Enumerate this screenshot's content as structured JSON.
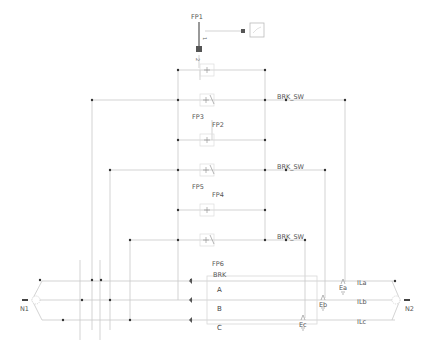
{
  "diagram": {
    "type": "power-circuit-schematic",
    "colors": {
      "wire": "#c8c8c8",
      "wire_dark": "#b0b0b0",
      "node": "#333333",
      "fault_block": "#555555",
      "label": "#555555",
      "bus_box": "#d8d8d8"
    },
    "labels": {
      "fp1": "FP1",
      "fp2": "FP2",
      "fp3": "FP3",
      "fp4": "FP4",
      "fp5": "FP5",
      "fp6": "FP6",
      "brk_sw_1": "BRK_SW",
      "brk_sw_2": "BRK_SW",
      "brk_sw_3": "BRK_SW",
      "brk": "BRK",
      "phase_a": "A",
      "phase_b": "B",
      "phase_c": "C",
      "ea": "Ea",
      "eb": "Eb",
      "ec": "Ec",
      "ila": "ILa",
      "ilb": "ILb",
      "ilc": "ILc",
      "n1": "N1",
      "n2": "N2",
      "port_1": "1",
      "port_2": "2"
    },
    "icons": {
      "source_a": "voltage-source-icon",
      "source_b": "voltage-source-icon",
      "source_c": "voltage-source-icon",
      "scope": "scope-icon",
      "fault_block": "fault-block-icon",
      "switch": "switch-icon",
      "current_meter": "current-meter-icon",
      "node_connector": "three-phase-connector-icon"
    }
  }
}
